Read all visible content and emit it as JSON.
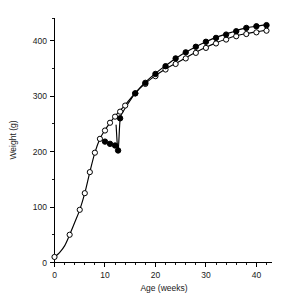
{
  "chart_data": {
    "type": "line",
    "title": "",
    "subtitle": "",
    "xlabel": "Age (weeks)",
    "ylabel": "Weight (g)",
    "xlim": [
      0,
      42
    ],
    "ylim": [
      0,
      440
    ],
    "x_ticks_major": [
      0,
      10,
      20,
      30,
      40
    ],
    "x_ticks_minor": [
      2,
      4,
      6,
      8,
      12,
      14,
      16,
      18,
      22,
      24,
      26,
      28,
      32,
      34,
      36,
      38,
      42
    ],
    "x_tick_labels": [
      "0",
      "10",
      "20",
      "30",
      "40"
    ],
    "y_ticks_major": [
      0,
      100,
      200,
      300,
      400
    ],
    "y_ticks_minor": [
      50,
      150,
      250,
      350,
      440
    ],
    "y_tick_labels": [
      "0",
      "100",
      "200",
      "300",
      "400"
    ],
    "grid": false,
    "legend": "none",
    "series": [
      {
        "name": "open-circles",
        "marker": "open-circle",
        "color": "#000000",
        "x": [
          0,
          3,
          5,
          6,
          7,
          8,
          9,
          10,
          11,
          12,
          13,
          14,
          16,
          18,
          20,
          22,
          24,
          26,
          28,
          30,
          32,
          34,
          36,
          38,
          40,
          42
        ],
        "y": [
          10,
          50,
          95,
          125,
          163,
          198,
          223,
          238,
          252,
          263,
          272,
          283,
          305,
          322,
          336,
          348,
          358,
          368,
          378,
          387,
          395,
          402,
          408,
          412,
          415,
          418
        ]
      },
      {
        "name": "filled-circles",
        "marker": "filled-circle",
        "color": "#000000",
        "x": [
          10,
          11,
          12,
          12.6,
          13,
          16,
          18,
          20,
          22,
          24,
          26,
          28,
          30,
          32,
          34,
          36,
          38,
          40,
          42
        ],
        "y": [
          218,
          214,
          211,
          202,
          260,
          305,
          324,
          340,
          354,
          368,
          379,
          389,
          398,
          405,
          411,
          417,
          423,
          426,
          428
        ]
      }
    ],
    "fitted_curves": [
      {
        "name": "open-circle-fit",
        "points_x": [
          0,
          1,
          2,
          3,
          4,
          5,
          6,
          7,
          8,
          9,
          10,
          11,
          12,
          13,
          14,
          16,
          18,
          20,
          22,
          24,
          26,
          28,
          30,
          32,
          34,
          36,
          38,
          40,
          42
        ],
        "points_y": [
          10,
          18,
          30,
          50,
          72,
          95,
          125,
          163,
          198,
          223,
          239,
          252,
          264,
          274,
          284,
          306,
          323,
          337,
          349,
          359,
          369,
          379,
          388,
          396,
          403,
          409,
          413,
          416,
          419
        ]
      },
      {
        "name": "filled-circle-fit",
        "points_x": [
          12.2,
          12.6,
          13,
          13.6,
          14.4,
          15.2,
          16,
          18,
          20,
          22,
          24,
          26,
          28,
          30,
          32,
          34,
          36,
          38,
          40,
          42
        ],
        "points_y": [
          248,
          202,
          258,
          272,
          284,
          295,
          305,
          325,
          341,
          355,
          368,
          379,
          389,
          398,
          406,
          412,
          418,
          423,
          426,
          429
        ]
      }
    ]
  },
  "axes": {
    "x_axis_title": "Age (weeks)",
    "y_axis_title": "Weight (g)"
  }
}
